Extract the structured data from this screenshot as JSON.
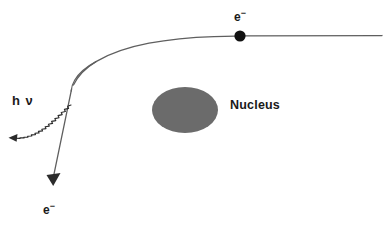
{
  "figure": {
    "background_color": "#ffffff",
    "width": 386,
    "height": 227,
    "labels": {
      "electron_top": "e",
      "electron_top_charge": "−",
      "electron_bottom": "e",
      "electron_bottom_charge": "−",
      "photon": "h ν",
      "nucleus": "Nucleus"
    },
    "colors": {
      "nucleus_fill": "#6b6b6b",
      "electron_dot": "#111111",
      "trajectory_line": "#5f5f5f",
      "photon_line": "#2b2b2b",
      "text": "#1a1a1a"
    },
    "elements": {
      "nucleus_ellipse": {
        "name": "nucleus-ellipse",
        "cx": 185,
        "cy": 110,
        "rx": 33,
        "ry": 23
      },
      "electron_dot": {
        "name": "electron-dot",
        "cx": 240,
        "cy": 36,
        "r": 5.5
      },
      "incoming_trajectory": {
        "name": "incoming-electron-trajectory",
        "description": "curve entering from the right, horizontal then bending down-left past the nucleus"
      },
      "outgoing_trajectory": {
        "name": "scattered-electron-trajectory",
        "description": "straight line descending to lower left ending in a solid arrowhead"
      },
      "photon_wave": {
        "name": "emitted-photon-wave",
        "description": "wavy line emitted toward the lower left with an arrowhead"
      }
    }
  }
}
